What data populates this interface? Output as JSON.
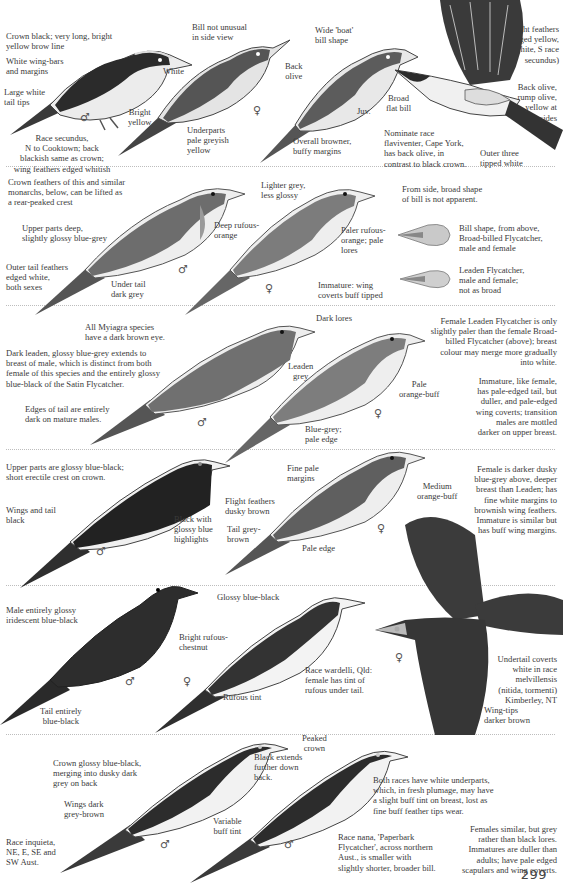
{
  "page": {
    "number": "299"
  },
  "sections": [
    {
      "name": "restless-flycatcher-group",
      "labels": [
        {
          "id": "crown",
          "text": "Crown black; very long, bright\nyellow brow line"
        },
        {
          "id": "wingbars",
          "text": "White wing-bars\nand margins"
        },
        {
          "id": "tailtips",
          "text": "Large white\ntail tips"
        },
        {
          "id": "white",
          "text": "White"
        },
        {
          "id": "brightyellow",
          "text": "Bright\nyellow"
        },
        {
          "id": "race",
          "text": "Race secundus,\nN to Cooktown; back\nblackish same as crown;\nwing feathers edged whitish"
        },
        {
          "id": "billnot",
          "text": "Bill not unusual\nin side view"
        },
        {
          "id": "wideboat",
          "text": "Wide 'boat'\nbill shape"
        },
        {
          "id": "backolive",
          "text": "Back\nolive"
        },
        {
          "id": "underparts",
          "text": "Underparts\npale greyish\nyellow"
        },
        {
          "id": "juv",
          "text": "Juv."
        },
        {
          "id": "overall",
          "text": "Overall browner,\nbuffy margins"
        },
        {
          "id": "flight",
          "text": "Flight feathers\nedged yellow,\n(white, S race\nsecundus)"
        },
        {
          "id": "broad",
          "text": "Broad\nflat bill"
        },
        {
          "id": "backolive2",
          "text": "Back olive,\nrump olive,\nyellow at\nsides"
        },
        {
          "id": "nominate",
          "text": "Nominate race\nflaviventer, Cape York,\nhas back olive, in\ncontrast to black crown."
        },
        {
          "id": "outer",
          "text": "Outer three\ntipped white"
        }
      ]
    },
    {
      "name": "broad-billed-flycatcher-group",
      "labels": [
        {
          "id": "crownfeathers",
          "text": "Crown feathers of this and similar\nmonarchs, below, can be lifted as\na rear-peaked crest"
        },
        {
          "id": "upperparts",
          "text": "Upper parts deep,\nslightly glossy blue-grey"
        },
        {
          "id": "outertail",
          "text": "Outer tail feathers\nedged white,\nboth sexes"
        },
        {
          "id": "undertail",
          "text": "Under tail\ndark grey"
        },
        {
          "id": "deeprufous",
          "text": "Deep rufous-\norange"
        },
        {
          "id": "lighter",
          "text": "Lighter grey,\nless glossy"
        },
        {
          "id": "paler",
          "text": "Paler rufous-\norange; pale\nlores"
        },
        {
          "id": "immature",
          "text": "Immature: wing\ncoverts buff tipped"
        },
        {
          "id": "fromside",
          "text": "From side, broad shape\nof bill is not apparent."
        },
        {
          "id": "billshape",
          "text": "Bill shape, from above,\nBroad-billed Flycatcher,\nmale and female"
        },
        {
          "id": "leaden",
          "text": "Leaden Flycatcher,\nmale and female;\nnot as broad"
        },
        {
          "id": "myiagra",
          "text": "All Myiagra species\nhave a dark brown eye."
        }
      ]
    },
    {
      "name": "leaden-flycatcher-group",
      "labels": [
        {
          "id": "darkleaden",
          "text": "Dark leaden, glossy blue-grey extends to\nbreast of male, which is distinct from both\nfemale of this species and the entirely glossy\nblue-black of the Satin Flycatcher."
        },
        {
          "id": "edges",
          "text": "Edges of tail are entirely\ndark on mature males."
        },
        {
          "id": "darklores",
          "text": "Dark lores"
        },
        {
          "id": "leadengrey",
          "text": "Leaden\ngrey"
        },
        {
          "id": "paleorange",
          "text": "Pale\norange-buff"
        },
        {
          "id": "bluegrey",
          "text": "Blue-grey;\npale edge"
        },
        {
          "id": "femaleleaden",
          "text": "Female Leaden Flycatcher is only\nslightly paler than the female Broad-\nbilled Flycatcher (above); breast\ncolour may merge more gradually\ninto white."
        },
        {
          "id": "immature2",
          "text": "Immature, like female,\nhas pale-edged tail, but\nduller, and pale-edged\nwing coverts; transition\nmales are mottled\ndarker on upper breast."
        }
      ]
    },
    {
      "name": "satin-flycatcher-group",
      "labels": [
        {
          "id": "glossy",
          "text": "Upper parts are glossy blue-black;\nshort erectile crest on crown."
        },
        {
          "id": "wingstail",
          "text": "Wings and tail\nblack"
        },
        {
          "id": "blackwith",
          "text": "Black with\nglossy blue\nhighlights"
        },
        {
          "id": "flightdusky",
          "text": "Flight feathers\ndusky brown"
        },
        {
          "id": "tailgrey",
          "text": "Tail grey-\nbrown"
        },
        {
          "id": "finepale",
          "text": "Fine pale\nmargins"
        },
        {
          "id": "medium",
          "text": "Medium\norange-buff"
        },
        {
          "id": "paleedge",
          "text": "Pale edge"
        },
        {
          "id": "femaledarker",
          "text": "Female is darker dusky\nblue-grey above, deeper\nbreast than Leaden; has\nfine white margins to\nbrownish wing feathers.\nImmature is similar but\nhas buff wing margins."
        }
      ]
    },
    {
      "name": "shining-flycatcher-group",
      "labels": [
        {
          "id": "maleentirely",
          "text": "Male entirely glossy\niridescent blue-black"
        },
        {
          "id": "tailentirely",
          "text": "Tail entirely\nblue-black"
        },
        {
          "id": "glossyblueblack",
          "text": "Glossy blue-black"
        },
        {
          "id": "brightrufous",
          "text": "Bright rufous-\nchestnut"
        },
        {
          "id": "rufoustint",
          "text": "Rufous tint"
        },
        {
          "id": "racewardelli",
          "text": "Race wardelli, Qld:\nfemale has tint of\nrufous under tail."
        },
        {
          "id": "undertailcoverts",
          "text": "Undertail coverts\nwhite in race\nmelvillensis\n(nitida, tormenti)\nKimberley, NT"
        },
        {
          "id": "wingtips",
          "text": "Wing-tips\ndarker brown"
        }
      ]
    },
    {
      "name": "restless-race-group",
      "labels": [
        {
          "id": "crownglossy",
          "text": "Crown glossy blue-black,\nmerging into dusky dark\ngrey on back"
        },
        {
          "id": "wingsdark",
          "text": "Wings dark\ngrey-brown"
        },
        {
          "id": "raceinquieta",
          "text": "Race inquieta,\nNE, E, SE and\nSW Aust."
        },
        {
          "id": "variable",
          "text": "Variable\nbuff tint"
        },
        {
          "id": "blackextends",
          "text": "Black extends\nfurther down\nback."
        },
        {
          "id": "peaked",
          "text": "Peaked\ncrown"
        },
        {
          "id": "bothraces",
          "text": "Both races have white underparts,\nwhich, in fresh plumage, may have\na slight buff tint on breast, lost as\nfine buff feather tips wear."
        },
        {
          "id": "racenana",
          "text": "Race nana, 'Paperbark\nFlycatcher', across northern\nAust., is smaller with\nslightly shorter, broader bill."
        },
        {
          "id": "females",
          "text": "Females similar, but grey\nrather than black lores.\nImmatures are duller than\nadults; have pale edged\nscapulars and wing coverts."
        }
      ]
    }
  ],
  "symbols": {
    "male": "♂",
    "female": "♀"
  },
  "colors": {
    "ink": "#3a3a3a",
    "bird_dark": "#2b2b2b",
    "bird_mid": "#6b6b6b",
    "bird_light": "#b9b9b9",
    "divider": "#bdbdbd"
  }
}
